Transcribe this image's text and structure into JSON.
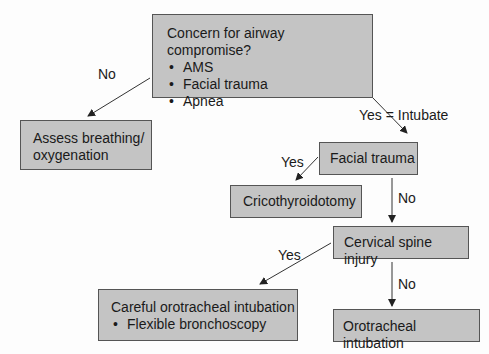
{
  "nodes": {
    "concern": {
      "title": "Concern for airway compromise?",
      "bullets": [
        "AMS",
        "Facial trauma",
        "Apnea"
      ]
    },
    "assess": {
      "line1": "Assess breathing/",
      "line2": "oxygenation"
    },
    "facial": {
      "title": "Facial trauma"
    },
    "crico": {
      "title": "Cricothyroidotomy"
    },
    "cspine": {
      "title": "Cervical spine injury"
    },
    "careful": {
      "title": "Careful orotracheal intubation",
      "bullets": [
        "Flexible bronchoscopy"
      ]
    },
    "oro": {
      "title": "Orotracheal intubation"
    }
  },
  "edges": {
    "concern_no": "No",
    "concern_yes": "Yes = Intubate",
    "facial_yes": "Yes",
    "facial_no": "No",
    "cspine_yes": "Yes",
    "cspine_no": "No"
  },
  "colors": {
    "box_fill": "#c4c4c4",
    "box_border": "#555555",
    "line": "#333333"
  }
}
